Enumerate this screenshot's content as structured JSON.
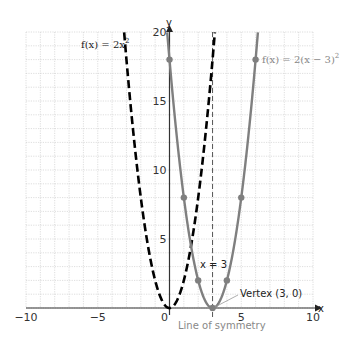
{
  "chart_data": {
    "type": "line",
    "title": "",
    "xlabel": "x",
    "ylabel": "y",
    "xlim": [
      -10,
      10
    ],
    "ylim": [
      0,
      20
    ],
    "grid": true,
    "grid_step": 1,
    "x_ticks": [
      -10,
      -5,
      0,
      5,
      10
    ],
    "x_tick_labels": [
      "−10",
      "−5",
      "0",
      "5",
      "10"
    ],
    "y_ticks": [
      5,
      10,
      15,
      20
    ],
    "y_tick_labels": [
      "5",
      "10",
      "15",
      "20"
    ],
    "series": [
      {
        "name": "f(x) = 2x²",
        "style": "dashed",
        "color": "#000000",
        "equation": "2*x^2",
        "points": [
          [
            -3.16,
            20
          ],
          [
            -3,
            18
          ],
          [
            -2,
            8
          ],
          [
            -1,
            2
          ],
          [
            0,
            0
          ],
          [
            1,
            2
          ],
          [
            2,
            8
          ],
          [
            3,
            18
          ],
          [
            3.16,
            20
          ]
        ]
      },
      {
        "name": "f(x) = 2(x − 3)²",
        "style": "solid",
        "color": "#7f7f7f",
        "equation": "2*(x-3)^2",
        "points": [
          [
            -0.16,
            20
          ],
          [
            0,
            18
          ],
          [
            1,
            8
          ],
          [
            2,
            2
          ],
          [
            3,
            0
          ],
          [
            4,
            2
          ],
          [
            5,
            8
          ],
          [
            6,
            18
          ],
          [
            6.16,
            20
          ]
        ],
        "marked_points": [
          [
            0,
            18
          ],
          [
            1,
            8
          ],
          [
            2,
            2
          ],
          [
            3,
            0
          ],
          [
            4,
            2
          ],
          [
            5,
            8
          ],
          [
            6,
            18
          ]
        ]
      }
    ],
    "annotations": [
      {
        "text": "f(x) = 2x²",
        "x": -3.7,
        "y": 18
      },
      {
        "text": "f(x) = 2(x − 3)²",
        "x": 6.4,
        "y": 18
      },
      {
        "text": "x = 3",
        "x": 2.1,
        "y": 3.2
      },
      {
        "text": "Vertex (3, 0)",
        "x": 4.3,
        "y": 1.6
      },
      {
        "text": "Line of symmetry",
        "x": 3,
        "y": -1.9
      }
    ],
    "reference_lines": [
      {
        "type": "vertical",
        "x": 3,
        "style": "dashed",
        "label": "x = 3"
      }
    ]
  },
  "labels": {
    "f1": "f(x) = 2x",
    "f1_exp": "2",
    "f2": "f(x) = 2(x − 3)",
    "f2_exp": "2",
    "axis_of_symmetry": "x = 3",
    "vertex": "Vertex (3, 0)",
    "line_of_symmetry": "Line of symmetry",
    "x_axis": "x",
    "y_axis": "y"
  }
}
